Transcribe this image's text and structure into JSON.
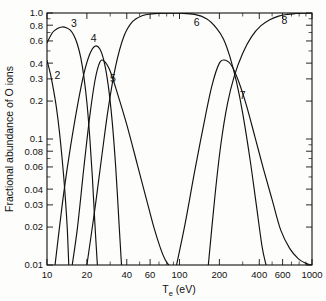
{
  "chart_data": {
    "type": "line",
    "title": "",
    "xlabel": "T_e (eV)",
    "xlabel_main": "T",
    "xlabel_sub": "e",
    "xlabel_unit": " (eV)",
    "ylabel": "Fractional abundance of O ions",
    "xscale": "log",
    "yscale": "log",
    "xlim": [
      10,
      1000
    ],
    "ylim": [
      0.01,
      1.0
    ],
    "grid": false,
    "legend_position": "inline-curve-labels",
    "x_ticks": [
      10,
      20,
      40,
      60,
      100,
      200,
      400,
      600,
      1000
    ],
    "x_tick_labels": [
      "10",
      "20",
      "40",
      "60",
      "100",
      "200",
      "400",
      "600",
      "1000"
    ],
    "x_minor_ticks": [
      30,
      50,
      70,
      80,
      90,
      300,
      500,
      700,
      800,
      900
    ],
    "y_ticks": [
      0.01,
      0.02,
      0.03,
      0.04,
      0.06,
      0.08,
      0.1,
      0.2,
      0.3,
      0.4,
      0.6,
      0.8,
      1.0
    ],
    "y_tick_labels": [
      "0.01",
      "0.02",
      "0.03",
      "0.04",
      "0.06",
      "0.08",
      "0.1",
      "0.2",
      "0.3",
      "0.4",
      "0.6",
      "0.8",
      "1.0"
    ],
    "y_minor_ticks": [
      0.05,
      0.07,
      0.09,
      0.5,
      0.7,
      0.9
    ],
    "series": [
      {
        "name": "2",
        "label": "2",
        "label_x": 12.0,
        "label_y": 0.32,
        "x": [
          10,
          10.6,
          11.2,
          11.8,
          12.4,
          13.0,
          13.6,
          14.2,
          14.6
        ],
        "values": [
          0.42,
          0.33,
          0.245,
          0.175,
          0.115,
          0.07,
          0.04,
          0.02,
          0.01
        ]
      },
      {
        "name": "3",
        "label": "3",
        "label_x": 16.0,
        "label_y": 0.82,
        "x": [
          10,
          11,
          12,
          13,
          14,
          15,
          16,
          17,
          18,
          19,
          20,
          21,
          22,
          23,
          24
        ],
        "values": [
          0.58,
          0.7,
          0.755,
          0.775,
          0.765,
          0.73,
          0.66,
          0.56,
          0.44,
          0.31,
          0.195,
          0.105,
          0.05,
          0.021,
          0.01
        ]
      },
      {
        "name": "4",
        "label": "4",
        "label_x": 22.5,
        "label_y": 0.63,
        "x": [
          11.5,
          12.5,
          13.5,
          15,
          17,
          19,
          21,
          23,
          25,
          27,
          29,
          31,
          33,
          35,
          36.5
        ],
        "values": [
          0.01,
          0.021,
          0.04,
          0.085,
          0.185,
          0.33,
          0.47,
          0.545,
          0.52,
          0.41,
          0.265,
          0.14,
          0.06,
          0.021,
          0.01
        ]
      },
      {
        "name": "5",
        "label": "5",
        "label_x": 31.5,
        "label_y": 0.3,
        "x": [
          15.5,
          17,
          19,
          21,
          23,
          25,
          27,
          30,
          34,
          40,
          48,
          56,
          64,
          72,
          78,
          83
        ],
        "values": [
          0.01,
          0.02,
          0.06,
          0.15,
          0.29,
          0.405,
          0.415,
          0.345,
          0.23,
          0.13,
          0.063,
          0.034,
          0.02,
          0.0135,
          0.011,
          0.01
        ]
      },
      {
        "name": "6",
        "label": "6",
        "label_x": 135,
        "label_y": 0.84,
        "x": [
          20,
          23,
          26,
          29,
          33,
          38,
          44,
          52,
          62,
          80,
          100,
          130,
          160,
          190,
          215,
          240,
          270,
          300,
          340,
          380,
          420,
          450
        ],
        "values": [
          0.01,
          0.028,
          0.075,
          0.175,
          0.38,
          0.65,
          0.85,
          0.95,
          0.985,
          0.998,
          0.995,
          0.975,
          0.9,
          0.76,
          0.62,
          0.45,
          0.28,
          0.16,
          0.07,
          0.03,
          0.014,
          0.01
        ]
      },
      {
        "name": "7",
        "label": "7",
        "label_x": 300,
        "label_y": 0.22,
        "x": [
          95,
          110,
          130,
          150,
          175,
          200,
          225,
          250,
          280,
          320,
          370,
          430,
          500,
          580,
          680,
          790,
          900,
          990
        ],
        "values": [
          0.01,
          0.021,
          0.055,
          0.12,
          0.26,
          0.4,
          0.42,
          0.375,
          0.285,
          0.185,
          0.105,
          0.058,
          0.033,
          0.019,
          0.0135,
          0.0112,
          0.0103,
          0.01
        ]
      },
      {
        "name": "8",
        "label": "8",
        "label_x": 620,
        "label_y": 0.87,
        "x": [
          165,
          185,
          205,
          230,
          260,
          300,
          350,
          410,
          480,
          560,
          650,
          750,
          850,
          1000
        ],
        "values": [
          0.01,
          0.035,
          0.09,
          0.19,
          0.32,
          0.48,
          0.65,
          0.79,
          0.885,
          0.945,
          0.975,
          0.99,
          0.997,
          1.0
        ]
      }
    ]
  }
}
